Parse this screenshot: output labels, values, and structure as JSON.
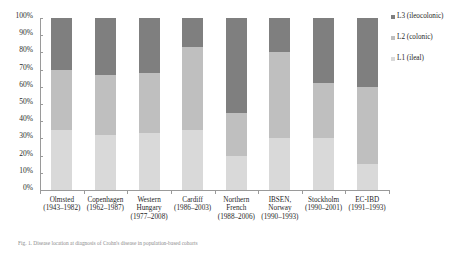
{
  "chart_data": {
    "type": "bar",
    "subtype": "stacked-percentage-column",
    "title": "",
    "xlabel": "",
    "ylabel": "",
    "ylim": [
      0,
      100
    ],
    "ytick_labels": [
      "100%",
      "90%",
      "80%",
      "70%",
      "60%",
      "50%",
      "40%",
      "30%",
      "20%",
      "10%",
      "0%"
    ],
    "ytick_values": [
      100,
      90,
      80,
      70,
      60,
      50,
      40,
      30,
      20,
      10,
      0
    ],
    "grid": false,
    "legend_position": "right",
    "categories": [
      "Olmsted (1943-1982)",
      "Copenhagen (1962-1987)",
      "Western Hungary (1977-2008)",
      "Cardiff (1986-2003)",
      "Northern French (1988-2006)",
      "IBSEN, Norway (1990-1993)",
      "Stockholm (1990-2001)",
      "EC-IBD (1991-1993)"
    ],
    "category_lines": [
      [
        "Olmsted",
        "(1943–1982)"
      ],
      [
        "Copenhagen",
        "(1962–1987)"
      ],
      [
        "Western",
        "Hungary",
        "(1977–2008)"
      ],
      [
        "Cardiff",
        "(1986–2003)"
      ],
      [
        "Northern",
        "French",
        "(1988–2006)"
      ],
      [
        "IBSEN,",
        "Norway",
        "(1990–1993)"
      ],
      [
        "Stockholm",
        "(1990–2001)"
      ],
      [
        "EC-IBD",
        "(1991–1993)"
      ]
    ],
    "series": [
      {
        "name": "L1 (ileal)",
        "key": "l1",
        "color": "#d9d9d9",
        "values": [
          35,
          32,
          33,
          35,
          20,
          30,
          30,
          15
        ]
      },
      {
        "name": "L2 (colonic)",
        "key": "l2",
        "color": "#bfbfbf",
        "values": [
          35,
          35,
          35,
          48,
          25,
          50,
          32,
          45
        ]
      },
      {
        "name": "L3 (ileocolonic)",
        "key": "l3",
        "color": "#7f7f7f",
        "values": [
          30,
          33,
          32,
          17,
          55,
          20,
          38,
          40
        ]
      }
    ],
    "legend_entries": [
      {
        "label": "L3 (ileocolonic)",
        "color": "#7f7f7f"
      },
      {
        "label": "L2 (colonic)",
        "color": "#bfbfbf"
      },
      {
        "label": "L1 (ileal)",
        "color": "#d9d9d9"
      }
    ]
  },
  "caption": {
    "text": "Fig. 1. Disease location at diagnosis of Crohn's disease in population-based cohorts"
  }
}
